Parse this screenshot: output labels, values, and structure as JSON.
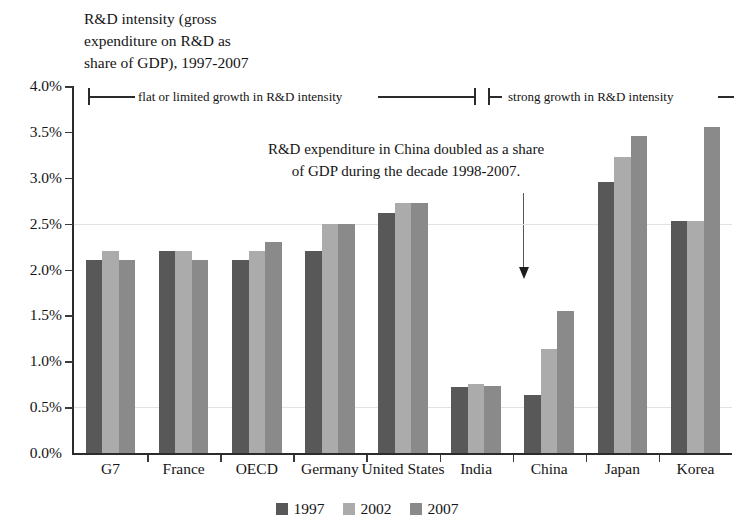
{
  "chart_data": {
    "type": "bar",
    "title": "R&D intensity (gross\nexpenditure on R&D as\nshare of GDP), 1997-2007",
    "xlabel": "",
    "ylabel": "",
    "ylim": [
      0,
      4.0
    ],
    "ytick_labels": [
      "4.0%",
      "3.5%",
      "3.0%",
      "2.5%",
      "2.0%",
      "1.5%",
      "1.0%",
      "0.5%",
      "0.0%"
    ],
    "ytick_values": [
      4.0,
      3.5,
      3.0,
      2.5,
      2.0,
      1.5,
      1.0,
      0.5,
      0.0
    ],
    "grid": true,
    "legend_position": "bottom",
    "categories": [
      "G7",
      "France",
      "OECD",
      "Germany",
      "United States",
      "India",
      "China",
      "Japan",
      "Korea"
    ],
    "series": [
      {
        "name": "1997",
        "color": "#585858",
        "values": [
          2.1,
          2.2,
          2.1,
          2.2,
          2.62,
          0.72,
          0.63,
          2.95,
          2.53
        ]
      },
      {
        "name": "2002",
        "color": "#ababab",
        "values": [
          2.2,
          2.2,
          2.2,
          2.5,
          2.72,
          0.75,
          1.13,
          3.23,
          2.53
        ]
      },
      {
        "name": "2007",
        "color": "#8a8a8a",
        "values": [
          2.1,
          2.1,
          2.3,
          2.5,
          2.72,
          0.73,
          1.55,
          3.45,
          3.55
        ]
      }
    ],
    "annotations": {
      "callout_text": "R&D expenditure in China doubled as a share\nof GDP during the decade 1998-2007.",
      "bracket_left_label": "flat or limited growth in R&D intensity",
      "bracket_right_label": "strong growth in R&D intensity"
    }
  }
}
